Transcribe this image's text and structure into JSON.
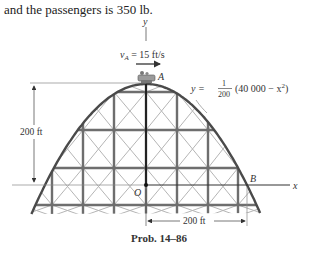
{
  "intro_text": "and the passengers is 350 lb.",
  "figure": {
    "axis_y_label": "y",
    "axis_x_label": "x",
    "origin_label": "O",
    "point_a_label": "A",
    "point_b_label": "B",
    "velocity_label_v": "v",
    "velocity_label_sub": "A",
    "velocity_label_value": " = 15 ft/s",
    "equation_lhs": "y = ",
    "equation_num": "1",
    "equation_den": "200",
    "equation_rhs": "(40 000 − x",
    "equation_exp": "2",
    "equation_close": ")",
    "height_dim_label": "200 ft",
    "width_dim_label": "200 ft"
  },
  "caption": "Prob. 14–86",
  "colors": {
    "truss": "#6e6e6e",
    "brace": "#b5b5b5",
    "track": "#4a4a4a",
    "dimension": "#555555"
  }
}
